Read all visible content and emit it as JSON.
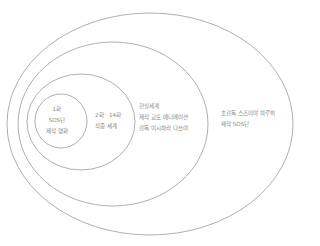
{
  "diagram": {
    "type": "nested-ellipses",
    "stroke_color": "#9a9a9a",
    "text_color": "#8a8a8a",
    "layers": [
      {
        "id": "outer",
        "lines": [
          "초감독 스즈미야 하루히",
          "제작 SOS단"
        ]
      },
      {
        "id": "real",
        "lines": [
          "현실세계",
          "제작 교토 애니메이션",
          "감독 이시하라 다쓰야"
        ]
      },
      {
        "id": "story",
        "lines": [
          "2화 · 14화",
          "작중 세계"
        ]
      },
      {
        "id": "inner",
        "lines": [
          "1화",
          "SOS단",
          "제작 영화"
        ]
      }
    ]
  }
}
